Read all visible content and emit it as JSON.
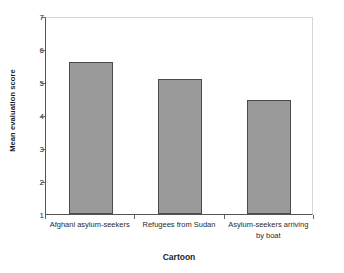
{
  "chart_data": {
    "type": "bar",
    "title": "",
    "xlabel": "Cartoon",
    "ylabel": "Mean evaluation score",
    "categories": [
      "Afghani asylum-seekers",
      "Refugees from Sudan",
      "Asylum-seekers arriving by boat"
    ],
    "category_lines": [
      [
        "Afghani asylum-seekers"
      ],
      [
        "Refugees from Sudan"
      ],
      [
        "Asylum-seekers arriving",
        "by boat"
      ]
    ],
    "values": [
      5.6,
      5.1,
      4.45
    ],
    "ylim": [
      1,
      7
    ],
    "yticks": [
      1,
      2,
      3,
      4,
      5,
      6,
      7
    ],
    "ytick_labels": [
      "1",
      "2",
      "3",
      "4",
      "5",
      "6",
      "7"
    ],
    "grid": false,
    "legend": false,
    "bar_fill_color": "#9a9a9a",
    "bar_edge_color": "#4a4a4a",
    "axis_color": "#555555",
    "frame_color": "#d6d6d6",
    "background_color": "#ffffff"
  }
}
